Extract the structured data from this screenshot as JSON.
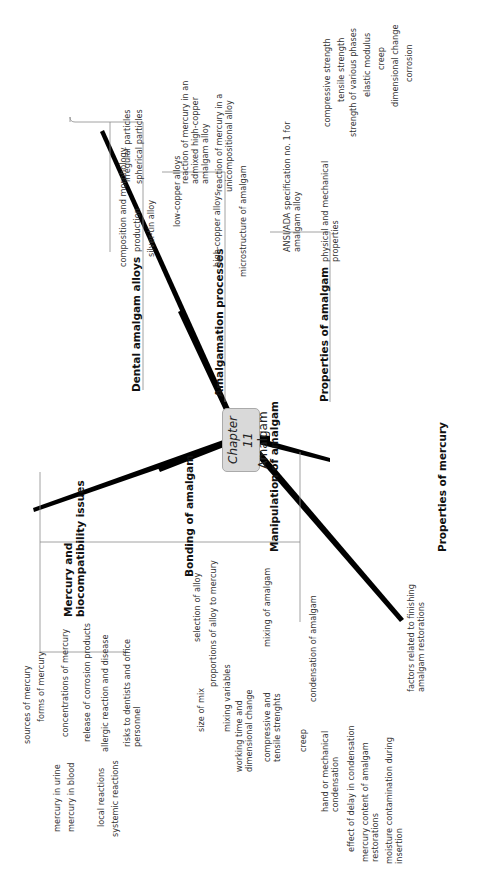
{
  "center": {
    "chapter": "Chapter 11",
    "title": "Amalgam"
  },
  "branches": {
    "dental_alloys": {
      "label": "Dental amalgam alloys",
      "children": {
        "composition": "composition and morphology",
        "production": "production",
        "irregular": "irregular particles",
        "spherical": "spherical particles",
        "silver_tin": "silver-tin alloy"
      }
    },
    "amalgamation": {
      "label": "Amalgamation processes",
      "children": {
        "low_copper": "low-copper alloys",
        "high_copper": "high-copper alloys",
        "admixed": "reaction of mercury in an admixed high-copper amalgam alloy",
        "unicompositional": "reaction of mercury in a unicompositional alloy",
        "microstructure": "microstructure of amalgam"
      }
    },
    "properties_amalgam": {
      "label": "Properties of amalgam",
      "children": {
        "ansi": "ANSI/ADA specification no. 1 for amalgam alloy",
        "physical": "physical and mechanical properties",
        "compressive": "compressive strength",
        "tensile": "tensile strength",
        "phases": "strength of various phases",
        "elastic": "elastic modulus",
        "creep": "creep",
        "dimensional": "dimensional change",
        "corrosion": "corrosion"
      }
    },
    "mercury_bio": {
      "label": "Mercury and biocompatibility issues",
      "children": {
        "sources": "sources of mercury",
        "forms": "forms of mercury",
        "concentrations": "concentrations of mercury",
        "urine": "mercury in urine",
        "blood": "mercury in blood",
        "corrosion_products": "release of corrosion products",
        "allergic": "allergic reaction and disease",
        "local": "local reactions",
        "systemic": "systemic reactions",
        "risks": "risks to dentists and office personnel"
      }
    },
    "bonding": {
      "label": "Bonding of amalgam"
    },
    "manipulation": {
      "label": "Manipulation of amalgam",
      "children": {
        "selection": "selection of alloy",
        "proportions": "proportions of alloy to mercury",
        "size_mix": "size of mix",
        "mixing": "mixing of amalgam",
        "mixing_vars": "mixing variables",
        "working_time": "working time and dimensional change",
        "comp_tensile": "compressive and tensile strenghts",
        "creep": "creep",
        "condensation": "condensation of amalgam",
        "hand_mech": "hand or mechanical condensation",
        "delay": "effect of delay in condensation",
        "hg_content": "mercury content of amalgam restorations",
        "moisture": "moisture contamination during insertion",
        "finishing": "factors related to finishing amalgam restorations"
      }
    },
    "properties_mercury": {
      "label": "Properties of mercury"
    }
  },
  "colors": {
    "spoke": "#000000",
    "line": "#8a8a8a",
    "center_fill": "#d9d9d9"
  }
}
